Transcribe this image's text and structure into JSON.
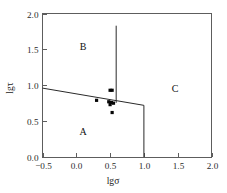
{
  "chart_data": {
    "type": "scatter",
    "title": "",
    "xlabel": "lgσ",
    "ylabel": "lgτ",
    "xlim": [
      -0.5,
      2.0
    ],
    "ylim": [
      0.0,
      2.0
    ],
    "grid": false,
    "legend": null,
    "xticks": [
      "−0.5",
      "0.0",
      "0.5",
      "1.0",
      "1.5",
      "2.0"
    ],
    "xtick_values": [
      -0.5,
      0.0,
      0.5,
      1.0,
      1.5,
      2.0
    ],
    "yticks": [
      "0.0",
      "0.5",
      "1.0",
      "1.5",
      "2.0"
    ],
    "ytick_values": [
      0.0,
      0.5,
      1.0,
      1.5,
      2.0
    ],
    "points": [
      {
        "x": 0.5,
        "y": 0.93
      },
      {
        "x": 0.53,
        "y": 0.93
      },
      {
        "x": 0.3,
        "y": 0.79
      },
      {
        "x": 0.48,
        "y": 0.77
      },
      {
        "x": 0.52,
        "y": 0.76
      },
      {
        "x": 0.55,
        "y": 0.75
      },
      {
        "x": 0.5,
        "y": 0.73
      },
      {
        "x": 0.53,
        "y": 0.62
      }
    ],
    "regions": [
      {
        "name": "A",
        "label": "A",
        "label_x": 0.1,
        "label_y": 0.31
      },
      {
        "name": "B",
        "label": "B",
        "label_x": 0.1,
        "label_y": 1.49
      },
      {
        "name": "C",
        "label": "C",
        "label_x": 1.46,
        "label_y": 0.9
      }
    ],
    "boundaries": [
      {
        "name": "ab-sloping-boundary",
        "kind": "line",
        "points": [
          [
            -0.5,
            0.96
          ],
          [
            1.0,
            0.72
          ]
        ]
      },
      {
        "name": "bc-vertical-boundary",
        "kind": "line",
        "points": [
          [
            0.59,
            1.83
          ],
          [
            0.59,
            0.755
          ]
        ]
      },
      {
        "name": "ac-vertical-boundary",
        "kind": "line",
        "points": [
          [
            1.0,
            0.72
          ],
          [
            1.0,
            0.0
          ]
        ]
      }
    ]
  },
  "axes": {
    "x_title": "lgσ",
    "y_title": "lgτ"
  }
}
